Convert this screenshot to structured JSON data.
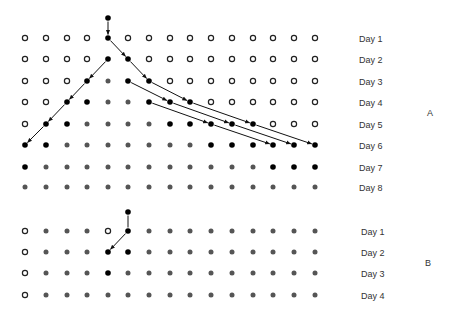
{
  "colors": {
    "black": "#000000",
    "gray": "#555555",
    "open_stroke": "#222222",
    "arrow": "#111111",
    "label": "#333333"
  },
  "grid": {
    "columns_x": [
      25,
      46,
      67,
      87,
      108,
      128,
      149,
      170,
      190,
      211,
      232,
      253,
      273,
      294,
      315
    ],
    "label_x": 359
  },
  "panels": [
    {
      "id": "A",
      "label": "A",
      "label_pos": [
        427,
        116
      ],
      "start_node": {
        "col": 4,
        "y": 18
      },
      "rows": [
        {
          "label": "Day 1",
          "y": 38,
          "states": "oooobOOOOOOOOOO"
        },
        {
          "label": "Day 2",
          "y": 59,
          "states": "oooobbooooooooo"
        },
        {
          "label": "Day 3",
          "y": 81,
          "states": "ooobgbbOOOOOOOO"
        },
        {
          "label": "Day 4",
          "y": 102,
          "states": "oobbggbbbOOOOOO"
        },
        {
          "label": "Day 5",
          "y": 124,
          "states": "obbggggbbbbbooo"
        },
        {
          "label": "Day 6",
          "y": 145,
          "states": "bbgggggggbbbbbb"
        },
        {
          "label": "Day 7",
          "y": 167,
          "states": "bgggggggggggbbb"
        },
        {
          "label": "Day 8",
          "y": 187,
          "states": "ggggggggggggggg"
        }
      ],
      "arrows": [
        {
          "from": [
            "start",
            4
          ],
          "to": [
            0,
            4
          ]
        },
        {
          "from": [
            0,
            4
          ],
          "to": [
            1,
            5
          ]
        },
        {
          "from": [
            1,
            5
          ],
          "to": [
            2,
            6
          ]
        },
        {
          "from": [
            2,
            5
          ],
          "to": [
            3,
            7
          ]
        },
        {
          "from": [
            2,
            6
          ],
          "to": [
            3,
            8
          ]
        },
        {
          "from": [
            3,
            6
          ],
          "to": [
            4,
            9
          ]
        },
        {
          "from": [
            3,
            7
          ],
          "to": [
            4,
            10
          ]
        },
        {
          "from": [
            3,
            8
          ],
          "to": [
            4,
            11
          ]
        },
        {
          "from": [
            4,
            9
          ],
          "to": [
            5,
            12
          ]
        },
        {
          "from": [
            4,
            10
          ],
          "to": [
            5,
            13
          ]
        },
        {
          "from": [
            4,
            11
          ],
          "to": [
            5,
            14
          ]
        },
        {
          "from": [
            1,
            4
          ],
          "to": [
            2,
            3
          ]
        },
        {
          "from": [
            2,
            3
          ],
          "to": [
            3,
            2
          ]
        },
        {
          "from": [
            3,
            2
          ],
          "to": [
            4,
            1
          ]
        },
        {
          "from": [
            4,
            1
          ],
          "to": [
            5,
            0
          ]
        }
      ]
    },
    {
      "id": "B",
      "label": "B",
      "label_pos": [
        425,
        266
      ],
      "start_node": {
        "col": 5,
        "y": 212
      },
      "rows": [
        {
          "label": "Day 1",
          "y": 231,
          "states": "ogggobggggggggg"
        },
        {
          "label": "Day 2",
          "y": 252,
          "states": "ogggbbggggggggg"
        },
        {
          "label": "Day 3",
          "y": 273,
          "states": "ogggbgggggggggg"
        },
        {
          "label": "Day 4",
          "y": 295,
          "states": "oggggggggggggggg"
        }
      ],
      "arrows": [
        {
          "from": [
            "start",
            5
          ],
          "to": [
            0,
            5
          ],
          "head": false
        },
        {
          "from": [
            0,
            5
          ],
          "to": [
            1,
            4
          ]
        }
      ]
    }
  ],
  "legend_states": {
    "o": "open-circle",
    "O": "open-circle",
    "b": "black-dot",
    "g": "gray-dot"
  }
}
